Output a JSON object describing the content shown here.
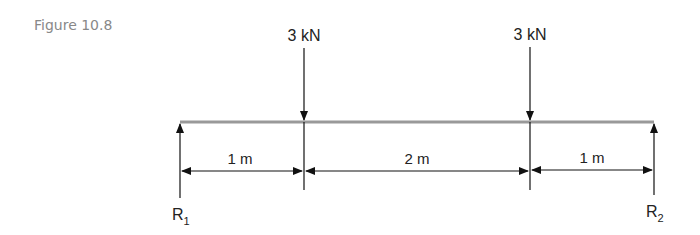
{
  "figure": {
    "label": "Figure 10.8",
    "label_color": "#888888"
  },
  "beam": {
    "color": "#999999",
    "supports": [
      {
        "name": "R",
        "sub": "1",
        "position_m": 0
      },
      {
        "name": "R",
        "sub": "2",
        "position_m": 4
      }
    ],
    "loads": [
      {
        "label": "3 kN",
        "position_m": 1
      },
      {
        "label": "3 kN",
        "position_m": 3
      }
    ],
    "spans": [
      {
        "label": "1 m"
      },
      {
        "label": "2 m"
      },
      {
        "label": "1 m"
      }
    ]
  }
}
